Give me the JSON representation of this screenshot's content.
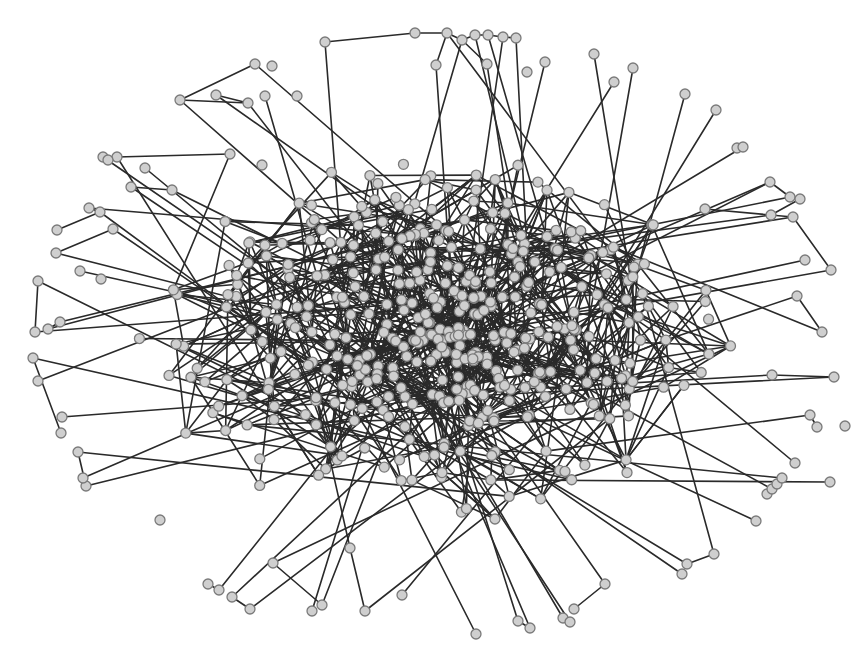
{
  "diagram": {
    "type": "network-graph",
    "width": 863,
    "height": 670,
    "style": {
      "background": "#ffffff",
      "node_fill": "#cfcfcf",
      "node_stroke": "#7a7a7a",
      "edge_color": "#2a2a2a",
      "node_radius": 5
    },
    "core": {
      "center": [
        440,
        340
      ],
      "radius_x": 230,
      "radius_y": 150,
      "node_count": 420,
      "edges_per_node": 2.4,
      "seed": 7
    },
    "peripheral_nodes": [
      [
        255,
        64
      ],
      [
        272,
        66
      ],
      [
        216,
        95
      ],
      [
        248,
        103
      ],
      [
        180,
        100
      ],
      [
        265,
        96
      ],
      [
        297,
        96
      ],
      [
        325,
        42
      ],
      [
        415,
        33
      ],
      [
        447,
        33
      ],
      [
        462,
        40
      ],
      [
        475,
        35
      ],
      [
        488,
        35
      ],
      [
        503,
        37
      ],
      [
        516,
        38
      ],
      [
        436,
        65
      ],
      [
        487,
        64
      ],
      [
        545,
        62
      ],
      [
        527,
        72
      ],
      [
        594,
        54
      ],
      [
        633,
        68
      ],
      [
        614,
        82
      ],
      [
        685,
        94
      ],
      [
        716,
        110
      ],
      [
        737,
        148
      ],
      [
        743,
        147
      ],
      [
        103,
        157
      ],
      [
        117,
        157
      ],
      [
        108,
        160
      ],
      [
        145,
        168
      ],
      [
        230,
        154
      ],
      [
        262,
        165
      ],
      [
        172,
        190
      ],
      [
        131,
        187
      ],
      [
        57,
        230
      ],
      [
        89,
        208
      ],
      [
        100,
        212
      ],
      [
        113,
        229
      ],
      [
        56,
        253
      ],
      [
        80,
        271
      ],
      [
        101,
        279
      ],
      [
        38,
        281
      ],
      [
        35,
        332
      ],
      [
        48,
        329
      ],
      [
        60,
        322
      ],
      [
        33,
        358
      ],
      [
        38,
        381
      ],
      [
        62,
        417
      ],
      [
        61,
        433
      ],
      [
        78,
        452
      ],
      [
        86,
        486
      ],
      [
        83,
        478
      ],
      [
        770,
        182
      ],
      [
        790,
        197
      ],
      [
        800,
        199
      ],
      [
        771,
        215
      ],
      [
        705,
        209
      ],
      [
        793,
        217
      ],
      [
        805,
        260
      ],
      [
        831,
        270
      ],
      [
        822,
        332
      ],
      [
        797,
        296
      ],
      [
        810,
        415
      ],
      [
        817,
        427
      ],
      [
        772,
        375
      ],
      [
        834,
        377
      ],
      [
        160,
        520
      ],
      [
        208,
        584
      ],
      [
        219,
        590
      ],
      [
        232,
        597
      ],
      [
        250,
        609
      ],
      [
        273,
        563
      ],
      [
        322,
        605
      ],
      [
        365,
        611
      ],
      [
        350,
        548
      ],
      [
        312,
        611
      ],
      [
        402,
        595
      ],
      [
        476,
        634
      ],
      [
        530,
        628
      ],
      [
        518,
        621
      ],
      [
        563,
        618
      ],
      [
        570,
        622
      ],
      [
        574,
        609
      ],
      [
        605,
        584
      ],
      [
        682,
        574
      ],
      [
        687,
        564
      ],
      [
        714,
        554
      ],
      [
        756,
        521
      ],
      [
        767,
        494
      ],
      [
        772,
        489
      ],
      [
        777,
        484
      ],
      [
        782,
        478
      ],
      [
        795,
        463
      ],
      [
        845,
        426
      ],
      [
        830,
        482
      ]
    ],
    "peripheral_edges": [
      [
        0,
        4
      ],
      [
        2,
        3
      ],
      [
        3,
        4
      ],
      [
        7,
        8
      ],
      [
        8,
        9
      ],
      [
        9,
        10
      ],
      [
        10,
        11
      ],
      [
        11,
        12
      ],
      [
        12,
        13
      ],
      [
        13,
        14
      ],
      [
        15,
        9
      ],
      [
        16,
        10
      ],
      [
        26,
        27
      ],
      [
        27,
        30
      ],
      [
        33,
        32
      ],
      [
        34,
        36
      ],
      [
        35,
        36
      ],
      [
        37,
        38
      ],
      [
        41,
        42
      ],
      [
        43,
        44
      ],
      [
        45,
        48
      ],
      [
        49,
        50
      ],
      [
        51,
        52
      ],
      [
        52,
        53
      ],
      [
        54,
        55
      ],
      [
        56,
        57
      ],
      [
        57,
        59
      ],
      [
        60,
        61
      ],
      [
        62,
        63
      ],
      [
        64,
        65
      ],
      [
        67,
        68
      ],
      [
        69,
        70
      ],
      [
        71,
        72
      ],
      [
        73,
        74
      ],
      [
        78,
        79
      ],
      [
        80,
        81
      ],
      [
        82,
        83
      ],
      [
        85,
        86
      ]
    ]
  }
}
